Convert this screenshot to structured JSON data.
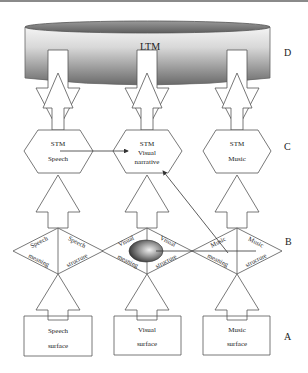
{
  "levels": {
    "D": "D",
    "C": "C",
    "B": "B",
    "A": "A"
  },
  "ltm": {
    "label": "LTM"
  },
  "columns": [
    {
      "id": "speech",
      "stm": {
        "line1": "STM",
        "line2": "Speech",
        "line3": ""
      },
      "diamond": {
        "left_top": "Speech",
        "left_bottom": "meaning",
        "right_top": "Speech",
        "right_bottom": "structure"
      },
      "surface": {
        "line1": "Speech",
        "line2": "surface"
      }
    },
    {
      "id": "visual",
      "stm": {
        "line1": "STM",
        "line2": "Visual",
        "line3": "narrative"
      },
      "diamond": {
        "left_top": "Visual",
        "left_bottom": "meaning",
        "right_top": "Visual",
        "right_bottom": "structure"
      },
      "surface": {
        "line1": "Visual",
        "line2": "surface"
      }
    },
    {
      "id": "music",
      "stm": {
        "line1": "STM",
        "line2": "Music",
        "line3": ""
      },
      "diamond": {
        "left_top": "Music",
        "left_bottom": "meaning",
        "right_top": "Music",
        "right_bottom": "structure"
      },
      "surface": {
        "line1": "Music",
        "line2": "surface"
      }
    }
  ],
  "colors": {
    "stroke": "#555555",
    "text": "#222222",
    "ltm_dark": "#6e6e6e",
    "ltm_light": "#f2f2f2"
  }
}
